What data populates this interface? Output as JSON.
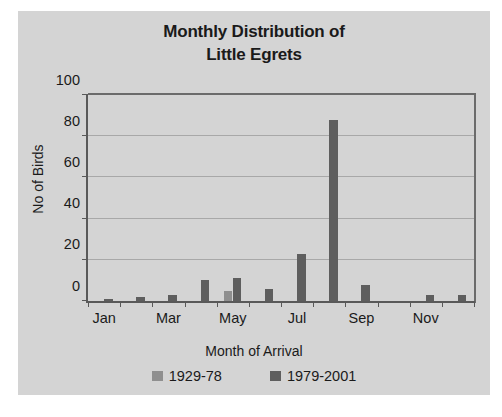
{
  "chart_data": {
    "type": "bar",
    "title": "Monthly Distribution of Little Egrets",
    "title_line1": "Monthly Distribution of",
    "title_line2": "Little Egrets",
    "xlabel": "Month of Arrival",
    "ylabel": "No of Birds",
    "ylim": [
      0,
      100
    ],
    "ytick_step": 20,
    "ytick_labels": [
      "0",
      "20",
      "40",
      "60",
      "80",
      "100"
    ],
    "ytick_values": [
      0,
      20,
      40,
      60,
      80,
      100
    ],
    "grid": "horizontal",
    "legend_position": "bottom",
    "categories": [
      "Jan",
      "Feb",
      "Mar",
      "Apr",
      "May",
      "Jun",
      "Jul",
      "Aug",
      "Sep",
      "Oct",
      "Nov",
      "Dec"
    ],
    "xtick_labels_shown": [
      "Jan",
      "",
      "Mar",
      "",
      "May",
      "",
      "Jul",
      "",
      "Sep",
      "",
      "Nov",
      ""
    ],
    "series": [
      {
        "name": "1929-78",
        "color": "#8f8f8f",
        "values": [
          0,
          0,
          0,
          0,
          5,
          0,
          0,
          0,
          0,
          0,
          0,
          0
        ]
      },
      {
        "name": "1979-2001",
        "color": "#5e5e5e",
        "values": [
          1,
          2,
          3,
          10,
          11,
          6,
          23,
          88,
          8,
          0,
          3,
          3
        ]
      }
    ]
  },
  "colors": {
    "chart_background": "#d4d4d4",
    "page_background": "#ffffff",
    "axis": "#595959",
    "gridline": "#a8a8a8",
    "text": "#1a1a1a",
    "series_1929_78": "#8f8f8f",
    "series_1979_2001": "#5e5e5e"
  }
}
